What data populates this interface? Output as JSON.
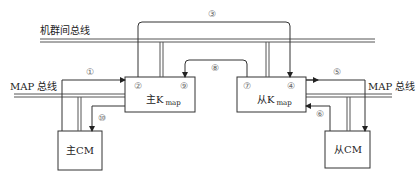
{
  "buses": {
    "cluster_bus": "机群间总线",
    "map_bus_left": "MAP 总线",
    "map_bus_right": "MAP 总线"
  },
  "boxes": {
    "master_kmap": {
      "main": "主K",
      "sub": "map"
    },
    "slave_kmap": {
      "main": "从K",
      "sub": "map"
    },
    "master_cm": "主CM",
    "slave_cm": "从CM"
  },
  "steps": {
    "s1": "①",
    "s2": "②",
    "s3": "③",
    "s4": "④",
    "s5": "⑤",
    "s6": "⑥",
    "s7": "⑦",
    "s8": "⑧",
    "s9": "⑨",
    "s10": "⑩"
  },
  "colors": {
    "line": "#333333",
    "bus_fill": "#9a9a9a",
    "step_label": "#666666"
  }
}
